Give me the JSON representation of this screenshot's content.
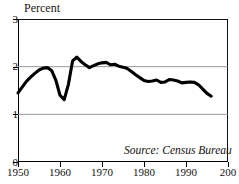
{
  "chart_data": {
    "type": "line",
    "title": "",
    "ylabel": "Percent",
    "xlabel": "",
    "ylim": [
      0,
      3
    ],
    "xlim": [
      1950,
      2000
    ],
    "grid": true,
    "gridlines_y": [
      1,
      2
    ],
    "legend": "none",
    "annotation": "Source: Census Bureau",
    "ytick_labels": [
      "0",
      "1",
      "2",
      "3"
    ],
    "ytick_values": [
      0,
      1,
      2,
      3
    ],
    "xtick_labels": [
      "1950",
      "1960",
      "1970",
      "1980",
      "1990",
      "200"
    ],
    "xtick_values": [
      1950,
      1960,
      1970,
      1980,
      1990,
      2000
    ],
    "series": [
      {
        "name": "Percent",
        "color": "#000000",
        "x": [
          1950,
          1951,
          1952,
          1953,
          1954,
          1955,
          1956,
          1957,
          1958,
          1959,
          1960,
          1961,
          1962,
          1963,
          1964,
          1965,
          1966,
          1967,
          1968,
          1969,
          1970,
          1971,
          1972,
          1973,
          1974,
          1975,
          1976,
          1977,
          1978,
          1979,
          1980,
          1981,
          1982,
          1983,
          1984,
          1985,
          1986,
          1987,
          1988,
          1989,
          1990,
          1991,
          1992,
          1993,
          1994,
          1995,
          1996
        ],
        "values": [
          1.45,
          1.57,
          1.69,
          1.78,
          1.86,
          1.93,
          1.97,
          1.98,
          1.92,
          1.72,
          1.4,
          1.31,
          1.63,
          2.12,
          2.2,
          2.11,
          2.04,
          1.98,
          2.02,
          2.06,
          2.08,
          2.09,
          2.04,
          2.05,
          2.01,
          1.99,
          1.96,
          1.9,
          1.83,
          1.77,
          1.71,
          1.69,
          1.7,
          1.72,
          1.67,
          1.68,
          1.73,
          1.72,
          1.7,
          1.66,
          1.67,
          1.68,
          1.67,
          1.62,
          1.53,
          1.44,
          1.38
        ]
      }
    ]
  },
  "chart": {
    "axis_title": "Percent",
    "source_note": "Source: Census Bureau"
  }
}
